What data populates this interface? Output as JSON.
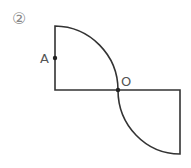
{
  "figure": {
    "number_label": "②",
    "points": [
      {
        "name": "A",
        "label": "A"
      },
      {
        "name": "O",
        "label": "O"
      }
    ],
    "colors": {
      "stroke": "#333333",
      "label": "#555555",
      "number": "#888888"
    }
  }
}
